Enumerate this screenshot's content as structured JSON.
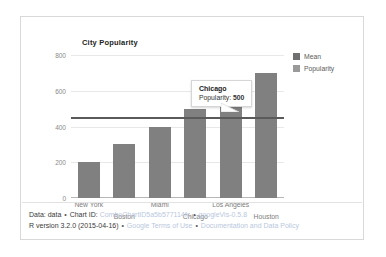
{
  "chart": {
    "title": "City Popularity"
  },
  "legend": {
    "items": [
      {
        "label": "Mean",
        "color": "#6f6f6f",
        "icon": "square-swatch-icon"
      },
      {
        "label": "Popularity",
        "color": "#9a9a9a",
        "icon": "square-swatch-icon"
      }
    ]
  },
  "tooltip": {
    "title": "Chicago",
    "metric_label": "Popularity:",
    "metric_value": "500"
  },
  "footer": {
    "line1": {
      "data_label": "Data: data",
      "sep1": "•",
      "chart_id_label": "Chart ID:",
      "chart_id": "ComboChartID5a5b577114fc",
      "sep2": "•",
      "version": "googleVis-0.5.8"
    },
    "line2": {
      "r_version": "R version 3.2.0 (2015-04-16)",
      "sep1": "•",
      "terms": "Google Terms of Use",
      "sep2": "•",
      "docs": "Documentation and Data Policy"
    }
  },
  "chart_data": {
    "type": "bar",
    "title": "City Popularity",
    "xlabel": "",
    "ylabel": "",
    "ylim": [
      0,
      800
    ],
    "yticks": [
      0,
      200,
      400,
      600,
      800
    ],
    "grid": true,
    "legend_position": "right",
    "categories": [
      "New York",
      "Boston",
      "Miami",
      "Chicago",
      "Los Angeles",
      "Houston"
    ],
    "series": [
      {
        "name": "Popularity",
        "type": "bar",
        "values": [
          200,
          300,
          400,
          500,
          550,
          700
        ]
      },
      {
        "name": "Mean",
        "type": "line",
        "values": [
          450,
          450,
          450,
          450,
          450,
          450
        ]
      }
    ],
    "annotations": [
      {
        "category": "Chicago",
        "series": "Popularity",
        "value": 500,
        "text": "Chicago Popularity: 500"
      }
    ]
  }
}
